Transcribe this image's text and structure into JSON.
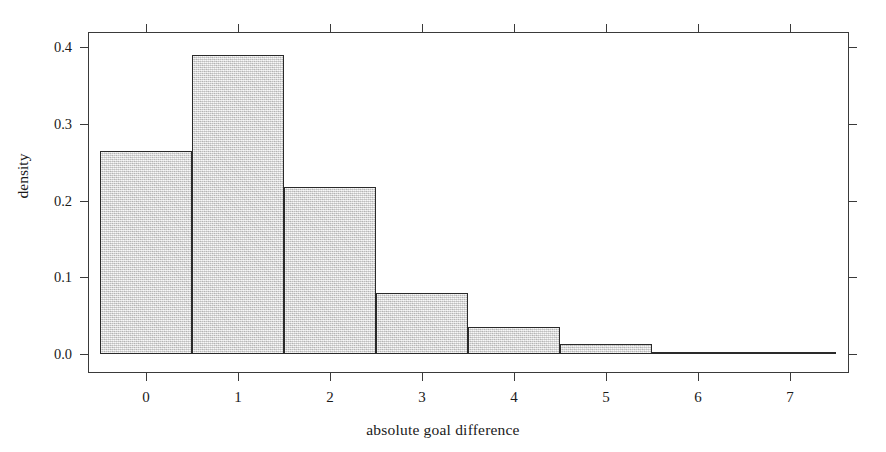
{
  "chart_data": {
    "type": "bar",
    "title": "",
    "xlabel": "absolute goal difference",
    "ylabel": "density",
    "categories": [
      "0",
      "1",
      "2",
      "3",
      "4",
      "5",
      "6",
      "7"
    ],
    "bin_edges": [
      -0.5,
      0.5,
      1.5,
      2.5,
      3.5,
      4.5,
      5.5,
      6.5,
      7.5
    ],
    "values": [
      0.265,
      0.39,
      0.218,
      0.08,
      0.035,
      0.013,
      0.003,
      0.001
    ],
    "xlim": [
      -0.5,
      7.5
    ],
    "ylim": [
      0.0,
      0.42
    ],
    "xticks": [
      0,
      1,
      2,
      3,
      4,
      5,
      6,
      7
    ],
    "xtick_labels": [
      "0",
      "1",
      "2",
      "3",
      "4",
      "5",
      "6",
      "7"
    ],
    "yticks": [
      0.0,
      0.1,
      0.2,
      0.3,
      0.4
    ],
    "ytick_labels": [
      "0.0",
      "0.1",
      "0.2",
      "0.3",
      "0.4"
    ],
    "grid": false,
    "legend": false,
    "bar_fill_color": "#d9d9d9",
    "bar_border_color": "#2a2a2a",
    "axis_color": "#3a3a3a",
    "background_color": "#ffffff"
  }
}
